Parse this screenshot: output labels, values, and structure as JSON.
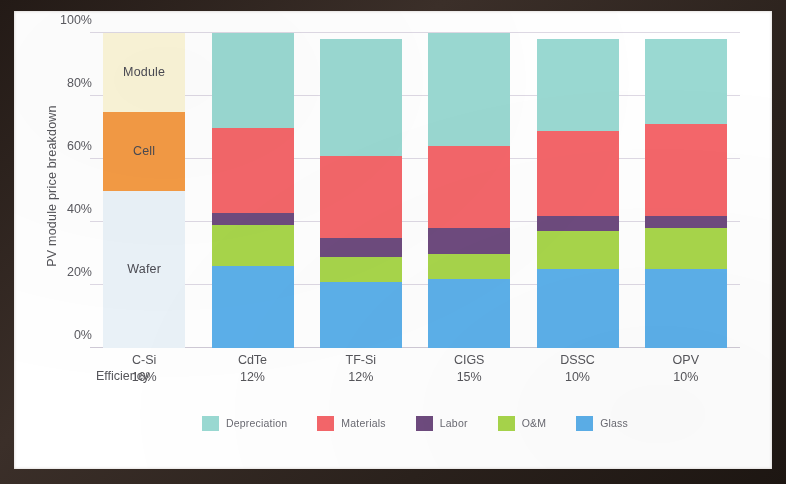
{
  "chart_data": {
    "type": "bar",
    "subtype": "stacked-percent",
    "title": "",
    "xlabel": "",
    "ylabel": "PV module price breakdown",
    "ylim": [
      0,
      100
    ],
    "yticks": [
      "0%",
      "20%",
      "40%",
      "60%",
      "80%",
      "100%"
    ],
    "ytick_values": [
      0,
      20,
      40,
      60,
      80,
      100
    ],
    "grid": true,
    "legend_position": "bottom-center",
    "categories": [
      "C-Si",
      "CdTe",
      "TF-Si",
      "CIGS",
      "DSSC",
      "OPV"
    ],
    "category_sublabels": [
      "16%",
      "12%",
      "12%",
      "15%",
      "10%",
      "10%"
    ],
    "sublabel_row_name": "Efficiency",
    "series": [
      {
        "name": "Depreciation",
        "color": "#9ad9d2",
        "values": [
          null,
          30,
          37,
          36,
          29,
          27
        ]
      },
      {
        "name": "Materials",
        "color": "#f4666a",
        "values": [
          null,
          27,
          26,
          26,
          27,
          29
        ]
      },
      {
        "name": "Labor",
        "color": "#6e4b7e",
        "values": [
          null,
          4,
          6,
          8,
          5,
          4
        ]
      },
      {
        "name": "O&M",
        "color": "#a8d64b",
        "values": [
          null,
          13,
          8,
          8,
          12,
          13
        ]
      },
      {
        "name": "Glass",
        "color": "#5cb0ea",
        "values": [
          null,
          26,
          21,
          22,
          25,
          25
        ]
      }
    ],
    "csi_series": [
      {
        "name": "Module",
        "color": "#fbf5d8",
        "value": 25
      },
      {
        "name": "Cell",
        "color": "#f49b45",
        "value": 25
      },
      {
        "name": "Wafer",
        "color": "#eaf2f8",
        "value": 50
      }
    ]
  },
  "axis": {
    "y_title": "PV module price breakdown",
    "ticks": [
      {
        "label": "100%",
        "value": 100
      },
      {
        "label": "80%",
        "value": 80
      },
      {
        "label": "60%",
        "value": 60
      },
      {
        "label": "40%",
        "value": 40
      },
      {
        "label": "20%",
        "value": 20
      },
      {
        "label": "0%",
        "value": 0
      }
    ]
  },
  "x_axis": {
    "efficiency_label": "Efficiency",
    "columns": [
      {
        "name": "C-Si",
        "efficiency": "16%"
      },
      {
        "name": "CdTe",
        "efficiency": "12%"
      },
      {
        "name": "TF-Si",
        "efficiency": "12%"
      },
      {
        "name": "CIGS",
        "efficiency": "15%"
      },
      {
        "name": "DSSC",
        "efficiency": "10%"
      },
      {
        "name": "OPV",
        "efficiency": "10%"
      }
    ]
  },
  "legend": {
    "items": [
      {
        "label": "Depreciation",
        "color": "#9ad9d2"
      },
      {
        "label": "Materials",
        "color": "#f4666a"
      },
      {
        "label": "Labor",
        "color": "#6e4b7e"
      },
      {
        "label": "O&M",
        "color": "#a8d64b"
      },
      {
        "label": "Glass",
        "color": "#5cb0ea"
      }
    ]
  },
  "csi_blocks": [
    {
      "label": "Module",
      "color": "#fbf5d8",
      "from": 75,
      "to": 100
    },
    {
      "label": "Cell",
      "color": "#f49b45",
      "from": 50,
      "to": 75
    },
    {
      "label": "Wafer",
      "color": "#eaf2f8",
      "from": 0,
      "to": 50
    }
  ],
  "colors": {
    "depreciation": "#9ad9d2",
    "materials": "#f4666a",
    "labor": "#6e4b7e",
    "om": "#a8d64b",
    "glass": "#5cb0ea",
    "module": "#fbf5d8",
    "cell": "#f49b45",
    "wafer": "#eaf2f8",
    "grid": "#ded9e4",
    "text": "#55555a"
  }
}
